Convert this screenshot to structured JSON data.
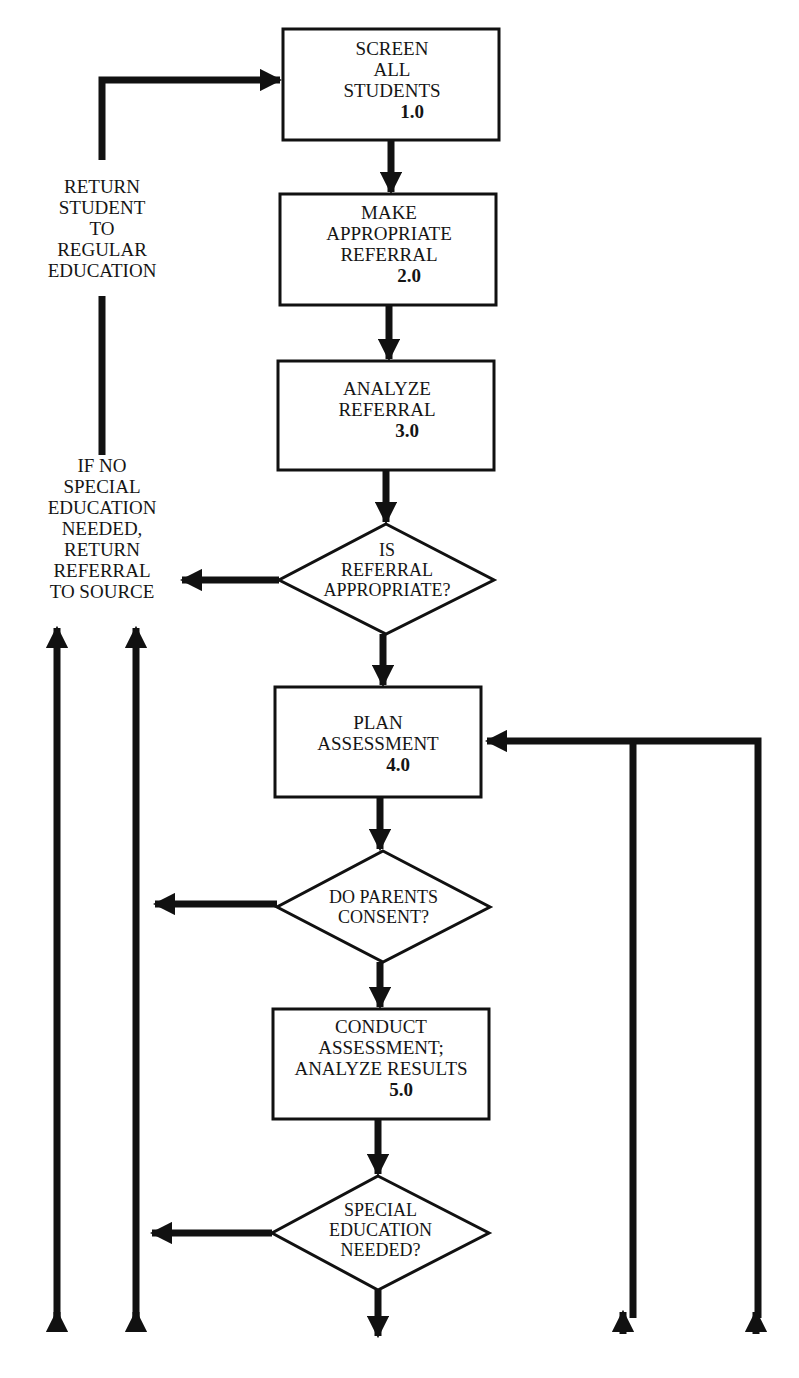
{
  "diagram": {
    "type": "flowchart",
    "colors": {
      "line": "#111111",
      "background": "#ffffff"
    },
    "nodes": [
      {
        "id": "1.0",
        "shape": "process",
        "lines": [
          "SCREEN",
          "ALL",
          "STUDENTS"
        ],
        "number": "1.0"
      },
      {
        "id": "2.0",
        "shape": "process",
        "lines": [
          "MAKE",
          "APPROPRIATE",
          "REFERRAL"
        ],
        "number": "2.0"
      },
      {
        "id": "3.0",
        "shape": "process",
        "lines": [
          "ANALYZE",
          "REFERRAL"
        ],
        "number": "3.0"
      },
      {
        "id": "d1",
        "shape": "decision",
        "lines": [
          "IS",
          "REFERRAL",
          "APPROPRIATE?"
        ]
      },
      {
        "id": "4.0",
        "shape": "process",
        "lines": [
          "PLAN",
          "ASSESSMENT"
        ],
        "number": "4.0"
      },
      {
        "id": "d2",
        "shape": "decision",
        "lines": [
          "DO PARENTS",
          "CONSENT?"
        ]
      },
      {
        "id": "5.0",
        "shape": "process",
        "lines": [
          "CONDUCT",
          "ASSESSMENT;",
          "ANALYZE RESULTS"
        ],
        "number": "5.0"
      },
      {
        "id": "d3",
        "shape": "decision",
        "lines": [
          "SPECIAL",
          "EDUCATION",
          "NEEDED?"
        ]
      }
    ],
    "annotations": [
      {
        "id": "return-student",
        "lines": [
          "RETURN",
          "STUDENT",
          "TO",
          "REGULAR",
          "EDUCATION"
        ]
      },
      {
        "id": "return-referral",
        "lines": [
          "IF NO",
          "SPECIAL",
          "EDUCATION",
          "NEEDED,",
          "RETURN",
          "REFERRAL",
          "TO SOURCE"
        ]
      }
    ],
    "edges": [
      {
        "from": "1.0",
        "to": "2.0"
      },
      {
        "from": "2.0",
        "to": "3.0"
      },
      {
        "from": "3.0",
        "to": "d1"
      },
      {
        "from": "d1",
        "to": "4.0",
        "label": ""
      },
      {
        "from": "d1",
        "to": "return-referral",
        "direction": "left"
      },
      {
        "from": "4.0",
        "to": "d2"
      },
      {
        "from": "d2",
        "to": "5.0"
      },
      {
        "from": "d2",
        "to": "left-branch",
        "direction": "left"
      },
      {
        "from": "5.0",
        "to": "d3"
      },
      {
        "from": "d3",
        "to": "left-branch",
        "direction": "left"
      },
      {
        "from": "d3",
        "to": "continues-below",
        "direction": "down"
      },
      {
        "from": "return-referral",
        "to": "return-student",
        "direction": "up"
      },
      {
        "from": "return-student",
        "to": "1.0",
        "direction": "up-right"
      },
      {
        "from": "below-right-1",
        "to": "4.0",
        "direction": "up-left"
      },
      {
        "from": "below-right-2",
        "to": "4.0",
        "direction": "up-left"
      },
      {
        "from": "below-left-1",
        "to": "return-referral",
        "direction": "up"
      },
      {
        "from": "below-left-2",
        "to": "return-referral",
        "direction": "up"
      }
    ]
  }
}
